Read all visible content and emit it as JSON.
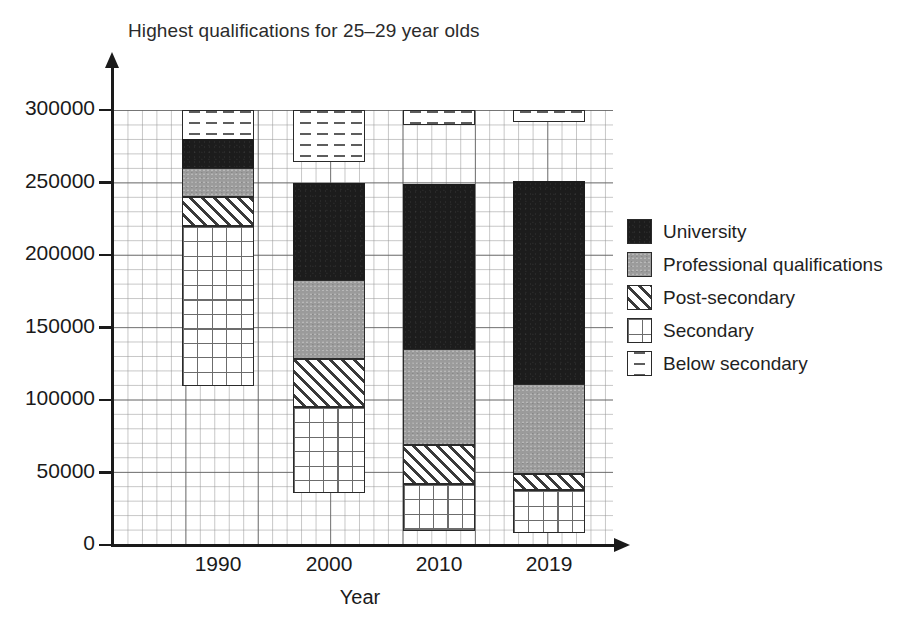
{
  "chart_data": {
    "type": "bar",
    "subtype": "stacked-bar",
    "title": "Highest qualifications for 25–29 year olds",
    "xlabel": "Year",
    "ylabel": "",
    "categories": [
      "1990",
      "2000",
      "2010",
      "2019"
    ],
    "ylim": [
      0,
      300000
    ],
    "ytick_labels": [
      "0",
      "50000",
      "100000",
      "150000",
      "200000",
      "250000",
      "300000"
    ],
    "ytick_values": [
      0,
      50000,
      100000,
      150000,
      200000,
      250000,
      300000
    ],
    "grid": true,
    "grid_minor_step": 10000,
    "legend_position": "right",
    "stack_order_bottom_to_top": [
      "Below secondary",
      "Secondary",
      "Post-secondary",
      "Professional qualifications",
      "University"
    ],
    "series": [
      {
        "name": "Below secondary",
        "pattern": "dashed-horizontal-lines",
        "color": "#ffffff",
        "values": [
          110000,
          36000,
          10000,
          8000
        ]
      },
      {
        "name": "Secondary",
        "pattern": "grid-crosshatch",
        "color": "#ffffff",
        "values": [
          110000,
          59000,
          32000,
          30000
        ]
      },
      {
        "name": "Post-secondary",
        "pattern": "diagonal-hatch",
        "color": "#ffffff",
        "values": [
          20000,
          33000,
          27000,
          11000
        ]
      },
      {
        "name": "Professional qualifications",
        "pattern": "solid-gray",
        "color": "#9b9b9b",
        "values": [
          20000,
          55000,
          66000,
          62000
        ]
      },
      {
        "name": "University",
        "pattern": "solid-black",
        "color": "#1c1c1c",
        "values": [
          20000,
          67000,
          114000,
          140000
        ]
      }
    ],
    "totals": [
      280000,
      250000,
      249000,
      251000
    ]
  },
  "legend": {
    "items": [
      {
        "label": "University",
        "swatch": "solid-black-swatch"
      },
      {
        "label": "Professional qualifications",
        "swatch": "solid-gray-swatch"
      },
      {
        "label": "Post-secondary",
        "swatch": "diagonal-hatch-swatch"
      },
      {
        "label": "Secondary",
        "swatch": "grid-crosshatch-swatch"
      },
      {
        "label": "Below secondary",
        "swatch": "dashed-lines-swatch"
      }
    ]
  }
}
